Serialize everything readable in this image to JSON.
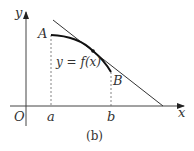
{
  "figure": {
    "caption": "(b)",
    "labels": {
      "y_axis": "y",
      "x_axis": "x",
      "origin": "O",
      "point_a": "A",
      "point_b": "B",
      "tick_a": "a",
      "tick_b": "b",
      "curve": "y = f(x)"
    },
    "colors": {
      "stroke": "#222222",
      "dash": "#555555",
      "text": "#333333"
    }
  }
}
